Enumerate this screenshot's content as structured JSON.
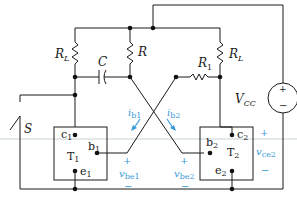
{
  "diagram": {
    "type": "circuit-schematic",
    "title": "",
    "components": {
      "RL_left": {
        "label": "R",
        "sub": "L"
      },
      "R": {
        "label": "R"
      },
      "RL_right": {
        "label": "R",
        "sub": "L"
      },
      "R1": {
        "label": "R",
        "sub": "1"
      },
      "C": {
        "label": "C"
      },
      "VCC": {
        "label": "V",
        "sub": "CC",
        "plus": "+",
        "minus": "−"
      },
      "S": {
        "label": "S"
      }
    },
    "transistors": [
      {
        "name": "T",
        "sub": "1",
        "c": "c",
        "c_sub": "1",
        "b": "b",
        "b_sub": "1",
        "e": "e",
        "e_sub": "1"
      },
      {
        "name": "T",
        "sub": "2",
        "c": "c",
        "c_sub": "2",
        "b": "b",
        "b_sub": "2",
        "e": "e",
        "e_sub": "2"
      }
    ],
    "annotations": {
      "ib1": {
        "label": "i",
        "sub": "b1"
      },
      "ib2": {
        "label": "i",
        "sub": "b2"
      },
      "vbe1": {
        "label": "v",
        "sub": "be1",
        "plus": "+",
        "minus": "−"
      },
      "vbe2": {
        "label": "v",
        "sub": "be2",
        "plus": "+",
        "minus": "−"
      },
      "vce2": {
        "label": "v",
        "sub": "ce2",
        "plus": "+",
        "minus": "−"
      }
    },
    "colors": {
      "wire": "#1a1a1a",
      "annotation": "#3a9ad9",
      "guide_line": "#b8c4cc"
    }
  }
}
